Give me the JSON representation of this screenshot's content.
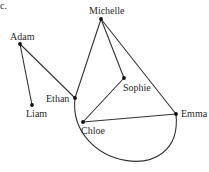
{
  "figure": {
    "part_label": "c.",
    "type": "graph",
    "nodes": [
      {
        "id": "michelle",
        "label": "Michelle",
        "x": 101,
        "y": 19,
        "lx": 89,
        "ly": 14
      },
      {
        "id": "adam",
        "label": "Adam",
        "x": 20,
        "y": 44,
        "lx": 10,
        "ly": 40
      },
      {
        "id": "liam",
        "label": "Liam",
        "x": 32,
        "y": 105,
        "lx": 26,
        "ly": 117
      },
      {
        "id": "ethan",
        "label": "Ethan",
        "x": 75,
        "y": 98,
        "lx": 46,
        "ly": 102
      },
      {
        "id": "sophie",
        "label": "Sophie",
        "x": 124,
        "y": 78,
        "lx": 123,
        "ly": 91
      },
      {
        "id": "chloe",
        "label": "Chloe",
        "x": 83,
        "y": 122,
        "lx": 81,
        "ly": 134
      },
      {
        "id": "emma",
        "label": "Emma",
        "x": 176,
        "y": 114,
        "lx": 181,
        "ly": 117
      }
    ],
    "edges": [
      {
        "from": "adam",
        "to": "liam",
        "kind": "line"
      },
      {
        "from": "adam",
        "to": "ethan",
        "kind": "line"
      },
      {
        "from": "ethan",
        "to": "michelle",
        "kind": "line"
      },
      {
        "from": "michelle",
        "to": "sophie",
        "kind": "line"
      },
      {
        "from": "michelle",
        "to": "emma",
        "kind": "line"
      },
      {
        "from": "sophie",
        "to": "chloe",
        "kind": "line"
      },
      {
        "from": "chloe",
        "to": "emma",
        "kind": "line"
      },
      {
        "from": "ethan",
        "to": "emma",
        "kind": "arc"
      }
    ]
  }
}
